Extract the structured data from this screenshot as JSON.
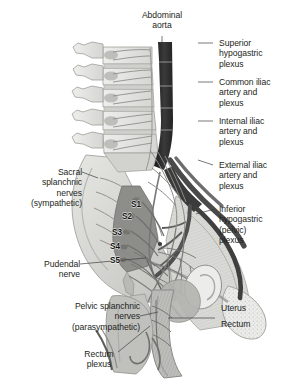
{
  "figure": {
    "background_color": "#ffffff",
    "text_color": "#231f20"
  },
  "labels": {
    "abdominal_aorta": "Abdominal\naorta",
    "superior_hypogastric_plexus": "Superior\nhypogastric\nplexus",
    "common_iliac": "Common iliac\nartery and\nplexus",
    "internal_iliac": "Internal iliac\nartery and\nplexus",
    "external_iliac": "External iliac\nartery and\nplexus",
    "inferior_hypogastric_plexus": "Inferior\nhypogastric\n(pelvic)\nplexus",
    "sacral_splanchnic": "Sacral\nsplanchnic\nnerves\n(sympathetic)",
    "pudendal_nerve": "Pudendal\nnerve",
    "pelvic_splanchnic": "Pelvic splanchnic\nnerves\n(parasympathetic)",
    "rectum_plexus": "Rectum\nplexus",
    "uterus": "Uterus",
    "rectum": "Rectum"
  },
  "vertebrae": {
    "s1": "S1",
    "s2": "S2",
    "s3": "S3",
    "s4": "S4",
    "s5": "S5"
  },
  "colors": {
    "bone_light": "#e3e3e1",
    "bone_mid": "#c9c9c6",
    "bone_dark": "#a8a8a4",
    "aorta_dark": "#2b2b2b",
    "vessel_mid": "#6f6f6f",
    "nerve_line": "#8d8d8d",
    "organ_mid": "#9a9a98",
    "organ_dark": "#6b6b69",
    "leader": "#444444"
  }
}
